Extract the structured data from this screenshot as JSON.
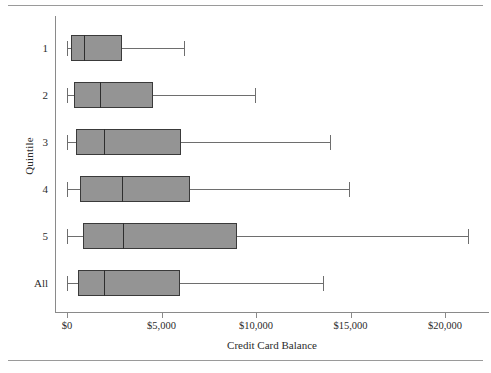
{
  "chart_data": {
    "type": "box",
    "title": "",
    "xlabel": "Credit Card Balance",
    "ylabel": "Quintile",
    "orientation": "horizontal",
    "grid": false,
    "legend": null,
    "xlim": [
      -500,
      22000
    ],
    "x_ticks": [
      0,
      5000,
      10000,
      15000,
      20000
    ],
    "x_tick_labels": [
      "$0",
      "$5,000",
      "$10,000",
      "$15,000",
      "$20,000"
    ],
    "categories": [
      "1",
      "2",
      "3",
      "4",
      "5",
      "All"
    ],
    "boxes": [
      {
        "category": "1",
        "min": 0,
        "q1": 200,
        "median": 900,
        "q3": 2900,
        "max": 6200
      },
      {
        "category": "2",
        "min": 0,
        "q1": 370,
        "median": 1750,
        "q3": 4550,
        "max": 9950
      },
      {
        "category": "3",
        "min": 0,
        "q1": 480,
        "median": 1960,
        "q3": 6030,
        "max": 13900
      },
      {
        "category": "4",
        "min": 0,
        "q1": 690,
        "median": 2900,
        "q3": 6500,
        "max": 14900
      },
      {
        "category": "5",
        "min": 0,
        "q1": 850,
        "median": 2960,
        "q3": 9000,
        "max": 21200
      },
      {
        "category": "All",
        "min": 0,
        "q1": 580,
        "median": 1960,
        "q3": 5980,
        "max": 13550
      }
    ],
    "colors": {
      "box_fill": "#949494",
      "box_edge": "#3a3a3a",
      "whisker": "#6e6e6e",
      "axis": "#8a8a8a",
      "text": "#2b2b2b",
      "rule": "#9a9a9a",
      "background": "#ffffff"
    }
  },
  "figure": {
    "top_rule": "",
    "bottom_rule": ""
  }
}
